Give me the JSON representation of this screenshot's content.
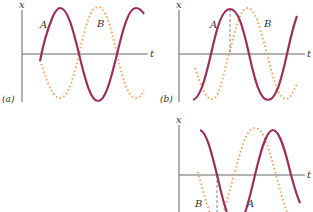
{
  "figure": {
    "panels": [
      {
        "id": "a",
        "panel_label": "(a)",
        "x_axis_label": "t",
        "y_axis_label": "x",
        "curve_a_label": "A",
        "curve_b_label": "B"
      },
      {
        "id": "b",
        "panel_label": "(b)",
        "x_axis_label": "t",
        "y_axis_label": "x",
        "curve_a_label": "A",
        "curve_b_label": "B"
      },
      {
        "id": "c",
        "panel_label": "",
        "x_axis_label": "t",
        "y_axis_label": "x",
        "curve_a_label": "A",
        "curve_b_label": "B"
      }
    ],
    "colors": {
      "curve_a": "#9b2f5a",
      "curve_b": "#f0a35a",
      "axis": "#555555"
    }
  }
}
